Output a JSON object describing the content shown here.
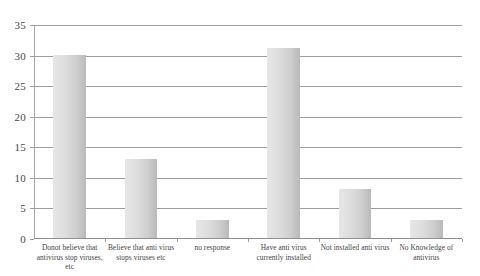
{
  "chart_data": {
    "type": "bar",
    "title": "",
    "subtitle": "",
    "xlabel": "",
    "ylabel": "",
    "ylim": [
      0,
      35
    ],
    "ytick_step": 5,
    "yticks": [
      "0",
      "5",
      "10",
      "15",
      "20",
      "25",
      "30",
      "35"
    ],
    "grid": true,
    "legend": false,
    "legend_position": "none",
    "categories": [
      "Donot believe that antivirus stop viruses, etc",
      "Believe that anti virus stops viruses etc",
      "no response",
      "Have anti virus currently installed",
      "Not installed anti virus",
      "No Knowledge of antivirus"
    ],
    "values": [
      30,
      13,
      3,
      31,
      8,
      3
    ],
    "series": [
      {
        "name": "Responses",
        "values": [
          30,
          13,
          3,
          31,
          8,
          3
        ]
      }
    ],
    "bar_color_light": "#e6e6e6",
    "bar_color_dark": "#b9b9b9",
    "gridline_color": "#9d9d9d",
    "axis_color": "#8f8f8f",
    "text_color": "#3f3f3f"
  }
}
